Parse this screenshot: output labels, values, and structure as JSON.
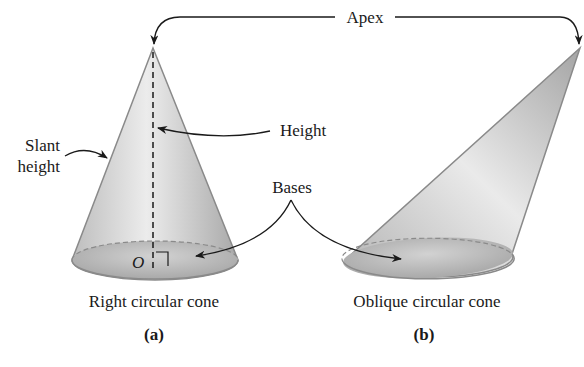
{
  "labels": {
    "apex": "Apex",
    "height": "Height",
    "slant_line1": "Slant",
    "slant_line2": "height",
    "bases": "Bases",
    "origin": "O",
    "cone_a_caption": "Right circular cone",
    "cone_b_caption": "Oblique circular cone",
    "panel_a": "(a)",
    "panel_b": "(b)"
  },
  "colors": {
    "cone_light": "#e6e6e6",
    "cone_mid": "#c4c4c4",
    "cone_dark": "#9a9a9a",
    "outline": "#8a8a8a",
    "ink": "#1a1a1a"
  }
}
